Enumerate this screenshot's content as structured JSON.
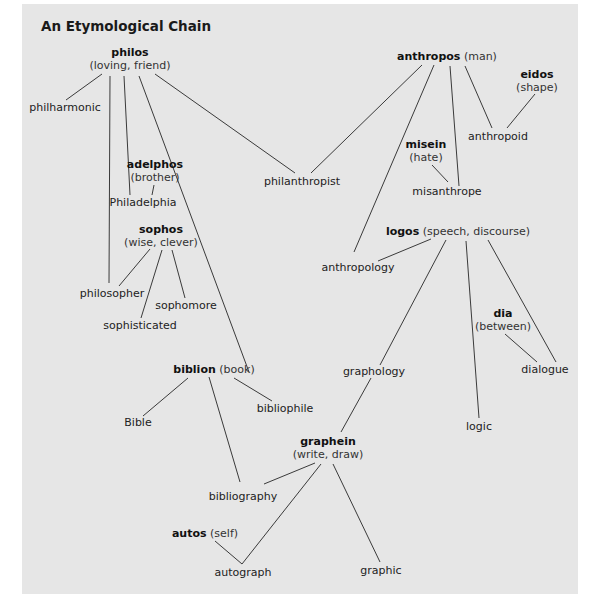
{
  "title": "An Etymological Chain",
  "roots": {
    "philos": {
      "root": "philos",
      "meaning": "(loving, friend)"
    },
    "anthropos": {
      "root": "anthropos",
      "meaning": "(man)"
    },
    "eidos": {
      "root": "eidos",
      "meaning": "(shape)"
    },
    "misein": {
      "root": "misein",
      "meaning": "(hate)"
    },
    "adelphos": {
      "root": "adelphos",
      "meaning": "(brother)"
    },
    "sophos": {
      "root": "sophos",
      "meaning": "(wise, clever)"
    },
    "logos": {
      "root": "logos",
      "meaning": "(speech, discourse)"
    },
    "dia": {
      "root": "dia",
      "meaning": "(between)"
    },
    "biblion": {
      "root": "biblion",
      "meaning": "(book)"
    },
    "graphein": {
      "root": "graphein",
      "meaning": "(write, draw)"
    },
    "autos": {
      "root": "autos",
      "meaning": "(self)"
    }
  },
  "words": {
    "philharmonic": "philharmonic",
    "philanthropist": "philanthropist",
    "anthropoid": "anthropoid",
    "misanthrope": "misanthrope",
    "philadelphia": "Philadelphia",
    "anthropology": "anthropology",
    "philosopher": "philosopher",
    "sophomore": "sophomore",
    "sophisticated": "sophisticated",
    "dialogue": "dialogue",
    "graphology": "graphology",
    "bible": "Bible",
    "bibliophile": "bibliophile",
    "logic": "logic",
    "bibliography": "bibliography",
    "autograph": "autograph",
    "graphic": "graphic"
  },
  "links": [
    {
      "from": "philos",
      "to": "philharmonic"
    },
    {
      "from": "philos",
      "to": "philosopher"
    },
    {
      "from": "philos",
      "to": "Philadelphia"
    },
    {
      "from": "philos",
      "to": "bibliophile"
    },
    {
      "from": "philos",
      "to": "philanthropist"
    },
    {
      "from": "anthropos",
      "to": "philanthropist"
    },
    {
      "from": "anthropos",
      "to": "anthropology"
    },
    {
      "from": "anthropos",
      "to": "misanthrope"
    },
    {
      "from": "anthropos",
      "to": "anthropoid"
    },
    {
      "from": "eidos",
      "to": "anthropoid"
    },
    {
      "from": "misein",
      "to": "misanthrope"
    },
    {
      "from": "adelphos",
      "to": "Philadelphia"
    },
    {
      "from": "sophos",
      "to": "philosopher"
    },
    {
      "from": "sophos",
      "to": "sophisticated"
    },
    {
      "from": "sophos",
      "to": "sophomore"
    },
    {
      "from": "logos",
      "to": "anthropology"
    },
    {
      "from": "logos",
      "to": "graphology"
    },
    {
      "from": "logos",
      "to": "logic"
    },
    {
      "from": "logos",
      "to": "dialogue"
    },
    {
      "from": "dia",
      "to": "dialogue"
    },
    {
      "from": "biblion",
      "to": "Bible"
    },
    {
      "from": "biblion",
      "to": "bibliophile"
    },
    {
      "from": "biblion",
      "to": "bibliography"
    },
    {
      "from": "graphology",
      "to": "graphein"
    },
    {
      "from": "graphein",
      "to": "bibliography"
    },
    {
      "from": "graphein",
      "to": "autograph"
    },
    {
      "from": "graphein",
      "to": "graphic"
    },
    {
      "from": "autos",
      "to": "autograph"
    }
  ]
}
